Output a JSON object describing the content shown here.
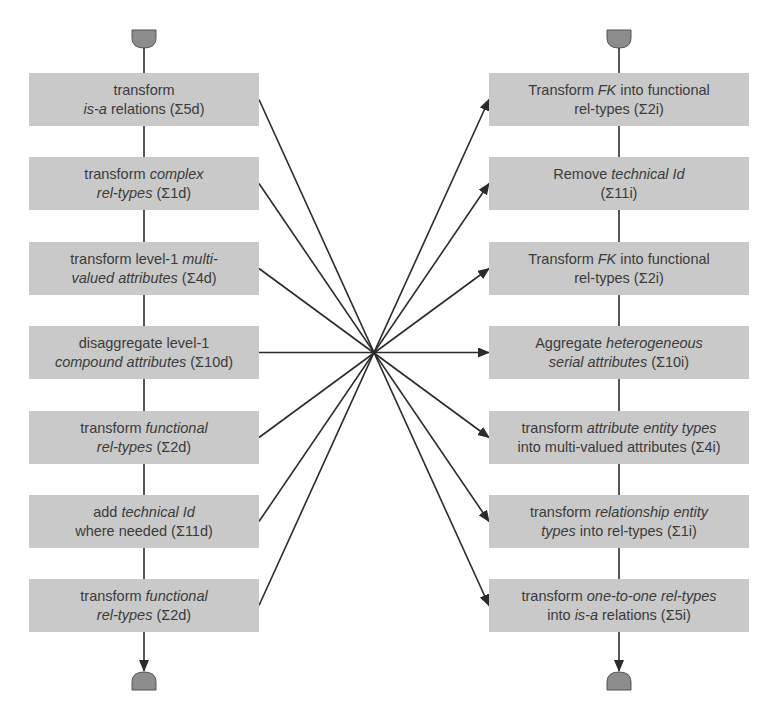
{
  "diagram": {
    "left_column": {
      "title": "direct transformations",
      "center_x": 144,
      "box_x": 29,
      "box_width": 230,
      "boxes": [
        {
          "lines": [
            [
              {
                "t": "transform",
                "i": false
              }
            ],
            [
              {
                "t": "is-a",
                "i": true
              },
              {
                "t": " relations (Σ5d)",
                "i": false
              }
            ]
          ]
        },
        {
          "lines": [
            [
              {
                "t": "transform ",
                "i": false
              },
              {
                "t": "complex",
                "i": true
              }
            ],
            [
              {
                "t": "rel-types",
                "i": true
              },
              {
                "t": " (Σ1d)",
                "i": false
              }
            ]
          ]
        },
        {
          "lines": [
            [
              {
                "t": "transform level-1 ",
                "i": false
              },
              {
                "t": "multi-",
                "i": true
              }
            ],
            [
              {
                "t": "valued attributes",
                "i": true
              },
              {
                "t": " (Σ4d)",
                "i": false
              }
            ]
          ]
        },
        {
          "lines": [
            [
              {
                "t": "disaggregate level-1",
                "i": false
              }
            ],
            [
              {
                "t": "compound attributes",
                "i": true
              },
              {
                "t": " (Σ10d)",
                "i": false
              }
            ]
          ]
        },
        {
          "lines": [
            [
              {
                "t": "transform ",
                "i": false
              },
              {
                "t": "functional",
                "i": true
              }
            ],
            [
              {
                "t": "rel-types",
                "i": true
              },
              {
                "t": " (Σ2d)",
                "i": false
              }
            ]
          ]
        },
        {
          "lines": [
            [
              {
                "t": "add ",
                "i": false
              },
              {
                "t": "technical Id",
                "i": true
              }
            ],
            [
              {
                "t": "where needed (Σ11d)",
                "i": false
              }
            ]
          ]
        },
        {
          "lines": [
            [
              {
                "t": "transform ",
                "i": false
              },
              {
                "t": "functional",
                "i": true
              }
            ],
            [
              {
                "t": "rel-types",
                "i": true
              },
              {
                "t": " (Σ2d)",
                "i": false
              }
            ]
          ]
        }
      ]
    },
    "right_column": {
      "center_x": 619,
      "box_x": 489,
      "box_width": 260,
      "boxes": [
        {
          "lines": [
            [
              {
                "t": "Transform ",
                "i": false
              },
              {
                "t": "FK",
                "i": true
              },
              {
                "t": " into functional",
                "i": false
              }
            ],
            [
              {
                "t": "rel-types (Σ2i)",
                "i": false
              }
            ]
          ]
        },
        {
          "lines": [
            [
              {
                "t": "Remove ",
                "i": false
              },
              {
                "t": "technical Id",
                "i": true
              }
            ],
            [
              {
                "t": "(Σ11i)",
                "i": false
              }
            ]
          ]
        },
        {
          "lines": [
            [
              {
                "t": "Transform ",
                "i": false
              },
              {
                "t": "FK",
                "i": true
              },
              {
                "t": " into functional",
                "i": false
              }
            ],
            [
              {
                "t": "rel-types (Σ2i)",
                "i": false
              }
            ]
          ]
        },
        {
          "lines": [
            [
              {
                "t": "Aggregate ",
                "i": false
              },
              {
                "t": "heterogeneous",
                "i": true
              }
            ],
            [
              {
                "t": "serial attributes",
                "i": true
              },
              {
                "t": " (Σ10i)",
                "i": false
              }
            ]
          ]
        },
        {
          "lines": [
            [
              {
                "t": "transform ",
                "i": false
              },
              {
                "t": "attribute entity types",
                "i": true
              }
            ],
            [
              {
                "t": "into multi-valued attributes (Σ4i)",
                "i": false
              }
            ]
          ]
        },
        {
          "lines": [
            [
              {
                "t": "transform ",
                "i": false
              },
              {
                "t": "relationship entity",
                "i": true
              }
            ],
            [
              {
                "t": "types",
                "i": true
              },
              {
                "t": " into rel-types (Σ1i)",
                "i": false
              }
            ]
          ]
        },
        {
          "lines": [
            [
              {
                "t": "transform ",
                "i": false
              },
              {
                "t": "one-to-one rel-types",
                "i": true
              }
            ],
            [
              {
                "t": "into ",
                "i": false
              },
              {
                "t": "is-a",
                "i": true
              },
              {
                "t": " relations (Σ5i)",
                "i": false
              }
            ]
          ]
        }
      ]
    },
    "box_tops": [
      73,
      157,
      242,
      326,
      411,
      495,
      579
    ],
    "box_height": 53,
    "cross_point": {
      "x": 373,
      "y": 352
    },
    "mapping": [
      {
        "from": 0,
        "to": 6
      },
      {
        "from": 1,
        "to": 5
      },
      {
        "from": 2,
        "to": 4
      },
      {
        "from": 3,
        "to": 3
      },
      {
        "from": 4,
        "to": 2
      },
      {
        "from": 5,
        "to": 1
      },
      {
        "from": 6,
        "to": 0
      }
    ],
    "colors": {
      "box_fill": "#c9c9c9",
      "terminator_fill": "#8c8c8c",
      "line": "#2b2b2b",
      "text": "#3b3b3b"
    }
  }
}
